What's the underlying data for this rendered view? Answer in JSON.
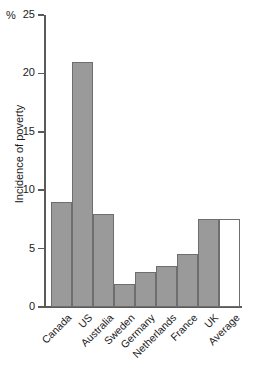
{
  "chart_data": {
    "type": "bar",
    "title": "",
    "subtitle": "",
    "xlabel": "",
    "ylabel": "Incidence of poverty",
    "unit_label": "%",
    "ylim": [
      0,
      25
    ],
    "yticks": [
      0,
      5,
      10,
      15,
      20,
      25
    ],
    "ytick_labels": [
      "0",
      "5",
      "10",
      "15",
      "20",
      "25"
    ],
    "grid": false,
    "legend": false,
    "categories": [
      "Canada",
      "US",
      "Australia",
      "Sweden",
      "Germany",
      "Netherlands",
      "France",
      "UK",
      "Average"
    ],
    "values": [
      9.0,
      21.0,
      8.0,
      2.0,
      3.0,
      3.5,
      4.5,
      7.5,
      7.5
    ],
    "bar_styles": [
      "filled",
      "filled",
      "filled",
      "filled",
      "filled",
      "filled",
      "filled",
      "filled",
      "hollow"
    ],
    "colors": {
      "bar_fill": "#9a9a9a",
      "bar_outline": "#6e6e6e",
      "average_fill": "#ffffff",
      "axis": "#5a5a5a",
      "text": "#1a1a1a",
      "background": "#ffffff"
    }
  }
}
